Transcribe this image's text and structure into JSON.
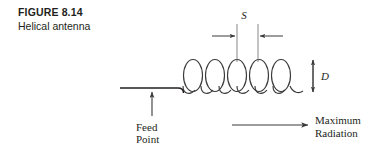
{
  "figure": {
    "number": "FIGURE 8.14",
    "title": "Helical antenna"
  },
  "labels": {
    "spacing": "S",
    "diameter": "D",
    "feed_line1": "Feed",
    "feed_line2": "Point",
    "radiation_line1": "Maximum",
    "radiation_line2": "Radiation"
  },
  "colors": {
    "ink": "#231f20",
    "line": "#3a3a3a",
    "background": "#ffffff"
  },
  "geometry": {
    "helix_turns": 5,
    "helix_left": 183,
    "helix_right": 303,
    "helix_top": 60,
    "helix_bottom": 92,
    "feed_line_y": 88,
    "feed_line_left": 120,
    "spacing_tick_left_x": 237,
    "spacing_tick_right_x": 258,
    "diameter_arrow_x": 313,
    "radiation_arrow_y": 125
  }
}
